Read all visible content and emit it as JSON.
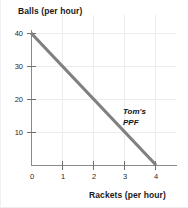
{
  "chart_data": {
    "type": "line",
    "title": "",
    "xlabel": "Rackets (per hour)",
    "ylabel": "Balls (per hour)",
    "xlim": [
      0,
      4.6
    ],
    "ylim": [
      0,
      43
    ],
    "grid": true,
    "legend": "none",
    "x_ticks": [
      "0",
      "1",
      "2",
      "3",
      "4"
    ],
    "x_tick_values": [
      0,
      1,
      2,
      3,
      4
    ],
    "y_ticks": [
      "10",
      "20",
      "30",
      "40"
    ],
    "y_tick_values": [
      10,
      20,
      30,
      40
    ],
    "series": [
      {
        "name": "Tom's PPF",
        "color": "#808080",
        "x": [
          0,
          4
        ],
        "values": [
          40,
          0
        ]
      }
    ],
    "annotations": [
      {
        "name": "ppf-label-line1",
        "text": "Tom's",
        "x": 3.0,
        "y": 14
      },
      {
        "name": "ppf-label-line2",
        "text": "PPF",
        "x": 3.0,
        "y": 10
      }
    ]
  },
  "axes": {
    "y_title": "Balls (per hour)",
    "x_title": "Rackets (per hour)",
    "y_tick_labels": [
      "40",
      "30",
      "20",
      "10"
    ],
    "x_tick_labels": [
      "0",
      "1",
      "2",
      "3",
      "4"
    ]
  },
  "annotation": {
    "line1": "Tom's",
    "line2": "PPF"
  },
  "colors": {
    "ppf_line": "#808080",
    "axis": "#8a8a8a",
    "grid": "#ececec",
    "text": "#1a1a1a",
    "background": "#ffffff"
  }
}
